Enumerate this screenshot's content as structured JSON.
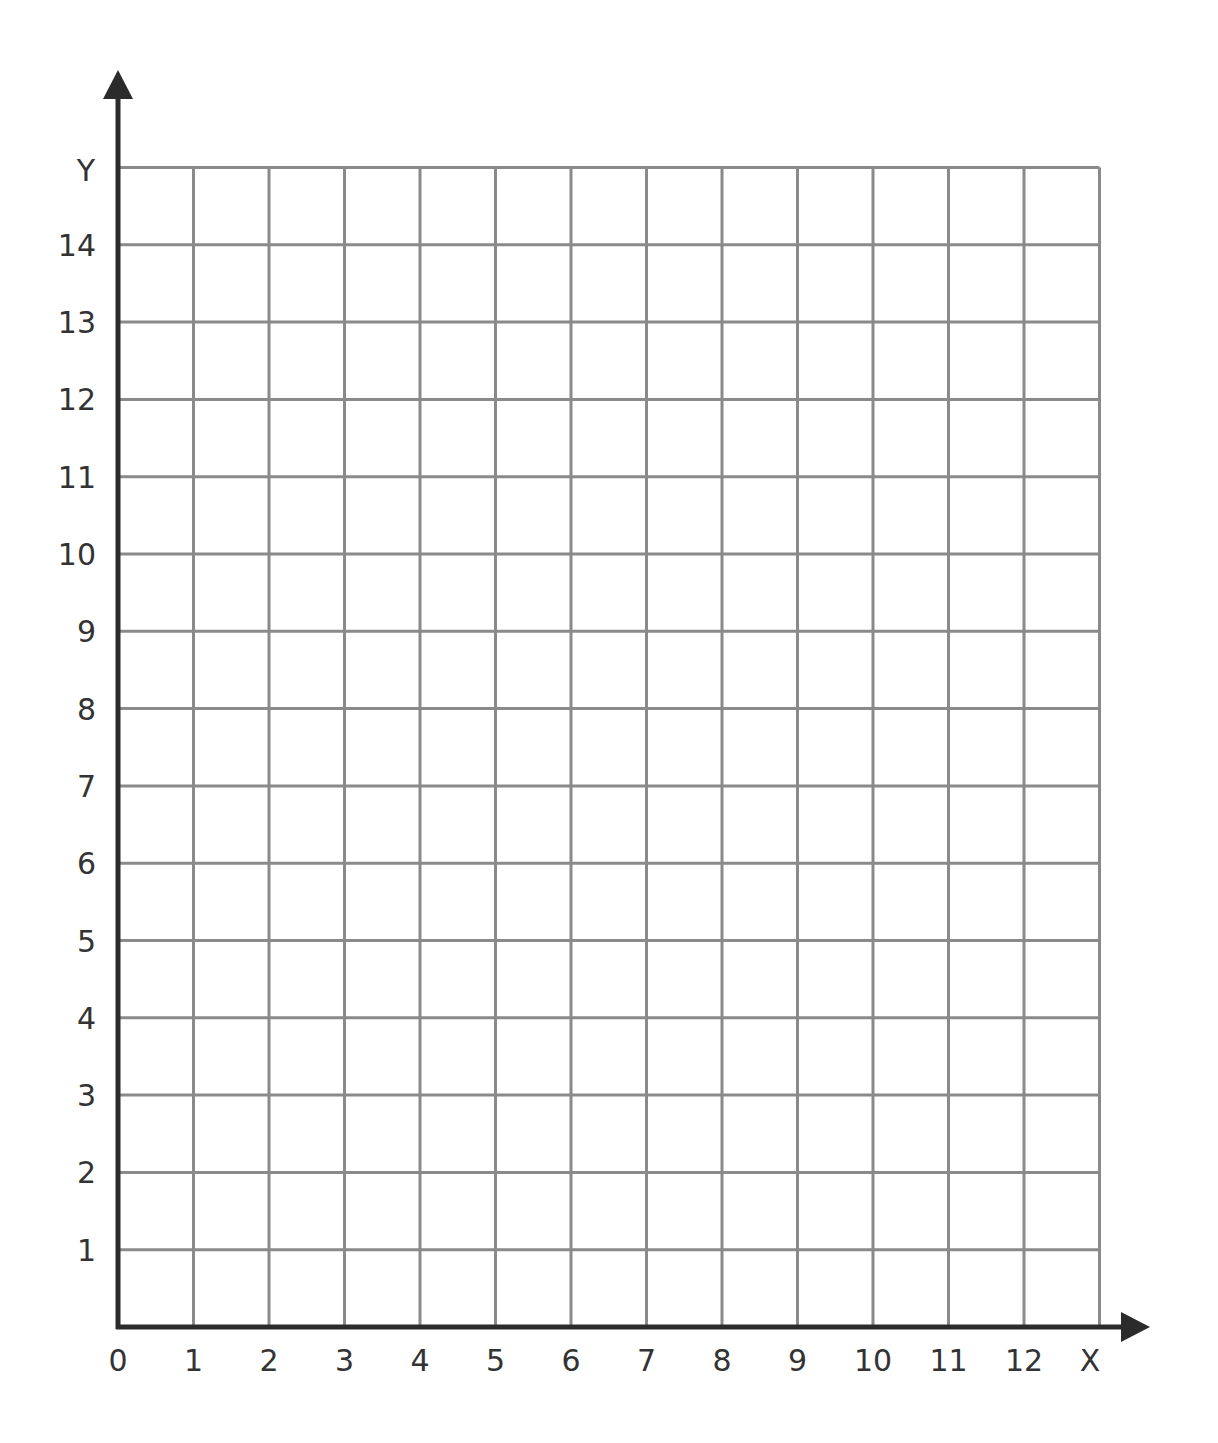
{
  "chart_data": {
    "type": "scatter",
    "title": "",
    "xlabel": "X",
    "ylabel": "Y",
    "xlim": [
      0,
      13
    ],
    "ylim": [
      0,
      15
    ],
    "x_ticks": [
      "0",
      "1",
      "2",
      "3",
      "4",
      "5",
      "6",
      "7",
      "8",
      "9",
      "10",
      "11",
      "12"
    ],
    "y_ticks": [
      "1",
      "2",
      "3",
      "4",
      "5",
      "6",
      "7",
      "8",
      "9",
      "10",
      "11",
      "12",
      "13",
      "14"
    ],
    "grid": true,
    "series": [],
    "legend": null
  },
  "labels": {
    "x_axis": "X",
    "y_axis": "Y",
    "origin": "0"
  },
  "colors": {
    "axis": "#2b2b2b",
    "grid": "#8a8a8a",
    "text": "#333333",
    "background": "#ffffff"
  },
  "geometry": {
    "origin_x": 118,
    "origin_y": 1327,
    "x_step": 75.5,
    "y_step": 77.3,
    "x_cells": 13,
    "y_cells": 15
  }
}
